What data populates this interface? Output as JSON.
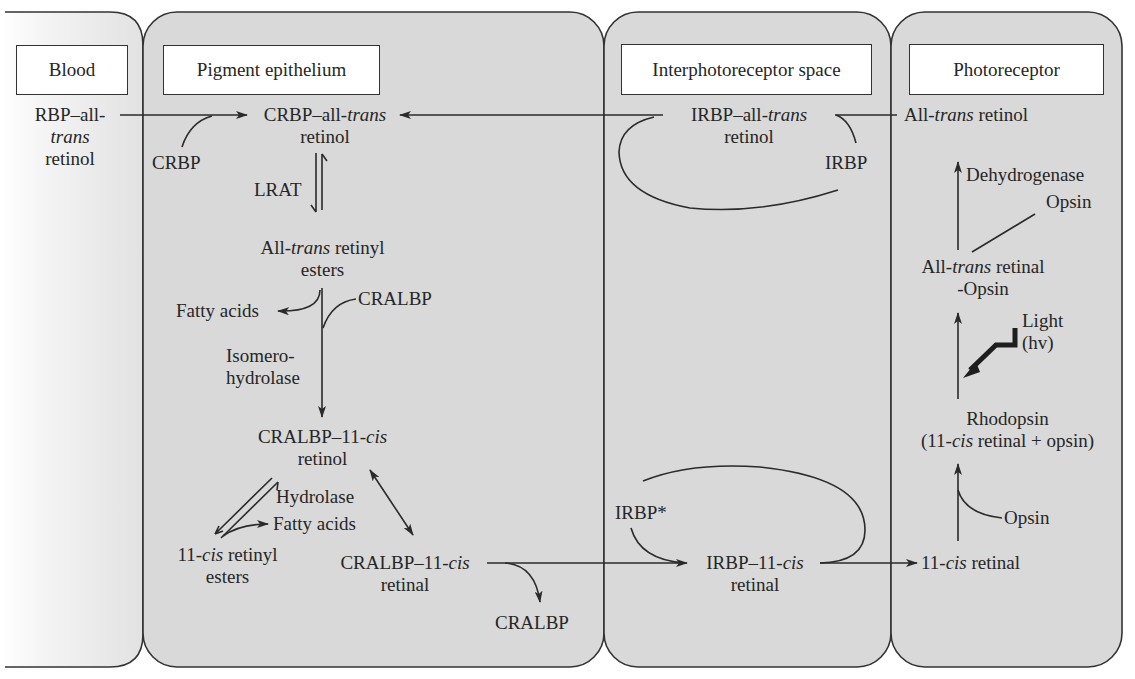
{
  "compartments": [
    {
      "id": "blood",
      "title": "Blood"
    },
    {
      "id": "pigment",
      "title": "Pigment epithelium"
    },
    {
      "id": "interphotoreceptor",
      "title": "Interphotoreceptor space"
    },
    {
      "id": "photoreceptor",
      "title": "Photoreceptor"
    }
  ],
  "blood": {
    "rbp_line1": "RBP–all-",
    "rbp_line2": "trans",
    "rbp_line3": "retinol"
  },
  "pigment": {
    "crbp_complex_a": "CRBP–all-",
    "crbp_complex_b": "trans",
    "crbp_complex_line2": "retinol",
    "crbp": "CRBP",
    "lrat": "LRAT",
    "esters_a": "All-",
    "esters_b": "trans",
    "esters_c": " retinyl",
    "esters_line2": "esters",
    "cralbp_in": "CRALBP",
    "fatty_acids_1": "Fatty acids",
    "isomero_1": "Isomero-",
    "isomero_2": "hydrolase",
    "cralbp_retinol_a": "CRALBP–11-",
    "cralbp_retinol_b": "cis",
    "cralbp_retinol_line2": "retinol",
    "hydrolase": "Hydrolase",
    "fatty_acids_2": "Fatty acids",
    "cis_esters_a": "11-",
    "cis_esters_b": "cis",
    "cis_esters_c": " retinyl",
    "cis_esters_line2": "esters",
    "cralbp_retinal_a": "CRALBP–11-",
    "cralbp_retinal_b": "cis",
    "cralbp_retinal_line2": "retinal",
    "cralbp_out": "CRALBP"
  },
  "interphotoreceptor": {
    "irbp_trans_a": "IRBP–all-",
    "irbp_trans_b": "trans",
    "irbp_trans_line2": "retinol",
    "irbp": "IRBP",
    "irbp_star": "IRBP*",
    "irbp_cis_a": "IRBP–11-",
    "irbp_cis_b": "cis",
    "irbp_cis_line2": "retinal"
  },
  "photoreceptor": {
    "trans_retinol_a": "All-",
    "trans_retinol_b": "trans",
    "trans_retinol_c": " retinol",
    "dehydrogenase": "Dehydrogenase",
    "opsin_top": "Opsin",
    "trans_retinal_a": "All-",
    "trans_retinal_b": "trans",
    "trans_retinal_c": " retinal",
    "trans_retinal_line2": "-Opsin",
    "light": "Light",
    "hv": "(hv)",
    "rhodopsin": "Rhodopsin",
    "rhodopsin_sub_a": "(11-",
    "rhodopsin_sub_b": "cis",
    "rhodopsin_sub_c": " retinal + opsin)",
    "opsin_bottom": "Opsin",
    "cis_retinal_a": "11-",
    "cis_retinal_b": "cis",
    "cis_retinal_c": " retinal"
  },
  "colors": {
    "panel_fill": "#d9d9d9",
    "line": "#2a2a2a",
    "header_fill": "#ffffff"
  }
}
